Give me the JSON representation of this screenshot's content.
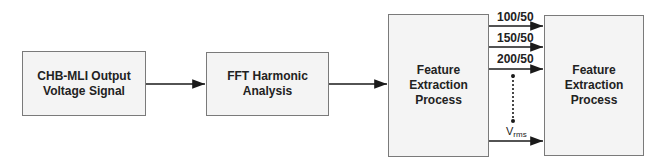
{
  "blocks": [
    {
      "id": "input",
      "label": "CHB-MLI Output Voltage Signal"
    },
    {
      "id": "fft",
      "label": "FFT Harmonic Analysis"
    },
    {
      "id": "feature1",
      "label": "Feature Extraction Process"
    },
    {
      "id": "feature2",
      "label": "Feature Extraction Process"
    }
  ],
  "outputs": [
    {
      "label": "100/50"
    },
    {
      "label": "150/50"
    },
    {
      "label": "200/50"
    },
    {
      "label_main": "V",
      "label_sub": "rms"
    }
  ],
  "colors": {
    "line": "#1a1a1a",
    "box_border": "#7a7a7a",
    "box_fill": "#f4f4f4"
  }
}
